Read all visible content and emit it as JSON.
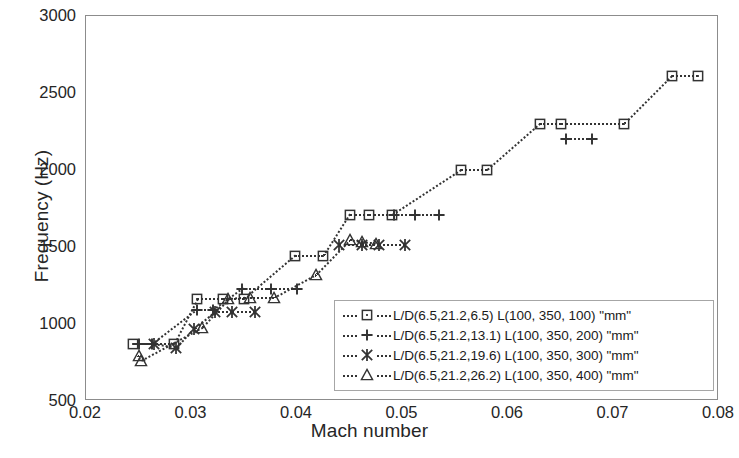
{
  "chart_data": {
    "type": "scatter",
    "title": "",
    "xlabel": "Mach number",
    "ylabel": "Frequency (Hz)",
    "xlim": [
      0.02,
      0.08
    ],
    "ylim": [
      500,
      3000
    ],
    "xticks": [
      "0.02",
      "0.03",
      "0.04",
      "0.05",
      "0.06",
      "0.07",
      "0.08"
    ],
    "xtick_values": [
      0.02,
      0.03,
      0.04,
      0.05,
      0.06,
      0.07,
      0.08
    ],
    "yticks": [
      "500",
      "1000",
      "1500",
      "2000",
      "2500",
      "3000"
    ],
    "ytick_values": [
      500,
      1000,
      1500,
      2000,
      2500,
      3000
    ],
    "grid": false,
    "legend_position": "inside-lower-right",
    "marker_color": "#333333",
    "frame_color": "#8c8c8c",
    "series": [
      {
        "name": "L/D(6.5,21.2,6.5)   L(100, 350, 100) \"mm\"",
        "marker": "square",
        "linestyle": "dotted",
        "x": [
          0.0245,
          0.0283,
          0.0305,
          0.033,
          0.035,
          0.0398,
          0.0425,
          0.045,
          0.0468,
          0.049,
          0.0555,
          0.058,
          0.063,
          0.065,
          0.071,
          0.0755,
          0.078
        ],
        "y": [
          870,
          870,
          1160,
          1160,
          1160,
          1440,
          1440,
          1710,
          1710,
          1710,
          2000,
          2000,
          2300,
          2300,
          2300,
          2610,
          2610
        ]
      },
      {
        "name": "L/D(6.5,21.2,13.1) L(100, 350, 200) \"mm\"",
        "marker": "plus",
        "linestyle": "dotted",
        "x": [
          0.025,
          0.0263,
          0.0305,
          0.032,
          0.0348,
          0.0375,
          0.04,
          0.0492,
          0.0512,
          0.0535,
          0.0655,
          0.068
        ],
        "y": [
          870,
          870,
          1090,
          1090,
          1230,
          1230,
          1230,
          1710,
          1710,
          1710,
          2200,
          2200
        ]
      },
      {
        "name": "L/D(6.5,21.2,19.6) L(100, 350, 300) \"mm\"",
        "marker": "asterisk",
        "linestyle": "dotted",
        "x": [
          0.0264,
          0.0285,
          0.0302,
          0.0322,
          0.0338,
          0.036,
          0.044,
          0.0462,
          0.0478,
          0.0502
        ],
        "y": [
          870,
          845,
          970,
          1080,
          1080,
          1080,
          1510,
          1510,
          1510,
          1510
        ]
      },
      {
        "name": "L/D(6.5,21.2,26.2) L(100, 350, 400) \"mm\"",
        "marker": "triangle",
        "linestyle": "dotted",
        "x": [
          0.025,
          0.0252,
          0.031,
          0.0335,
          0.0355,
          0.0378,
          0.0418,
          0.045,
          0.0462,
          0.0475
        ],
        "y": [
          790,
          760,
          975,
          1160,
          1170,
          1170,
          1320,
          1545,
          1530,
          1520
        ]
      }
    ],
    "legend_entries": [
      {
        "marker": "square",
        "label": "L/D(6.5,21.2,6.5)   L(100, 350, 100) \"mm\""
      },
      {
        "marker": "plus",
        "label": "L/D(6.5,21.2,13.1) L(100, 350, 200) \"mm\""
      },
      {
        "marker": "asterisk",
        "label": "L/D(6.5,21.2,19.6) L(100, 350, 300) \"mm\""
      },
      {
        "marker": "triangle",
        "label": "L/D(6.5,21.2,26.2) L(100, 350, 400) \"mm\""
      }
    ]
  }
}
